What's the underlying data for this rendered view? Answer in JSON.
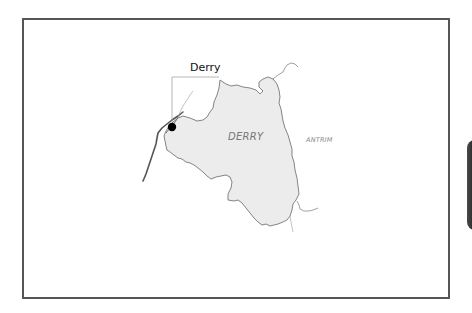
{
  "map": {
    "city_label": "Derry",
    "county_label": "DERRY",
    "neighbor_label": "ANTRIM",
    "colors": {
      "county_fill": "#ececec",
      "county_border": "#777777",
      "river": "#555555",
      "frame": "#555555",
      "city_dot": "#000000"
    },
    "city_marker": {
      "name": "Derry",
      "x": 172,
      "y": 127
    }
  }
}
